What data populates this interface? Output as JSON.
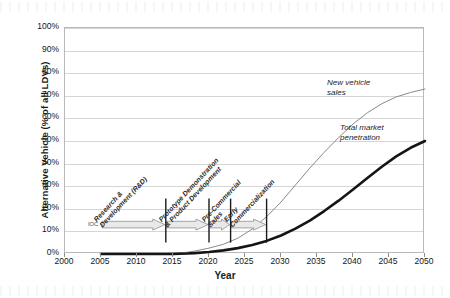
{
  "chart_data": {
    "type": "line",
    "title": "",
    "xlabel": "Year",
    "ylabel": "Alternative Vehicle (% of all LDVs)",
    "xlim": [
      2000,
      2050
    ],
    "ylim": [
      0,
      100
    ],
    "grid": true,
    "legend_position": "inline-callout",
    "x_ticks": [
      "2000",
      "2005",
      "2010",
      "2015",
      "2020",
      "2025",
      "2030",
      "2035",
      "2040",
      "2045",
      "2050"
    ],
    "y_ticks": [
      "0%",
      "10%",
      "20%",
      "30%",
      "40%",
      "50%",
      "60%",
      "70%",
      "80%",
      "90%",
      "100%"
    ],
    "x": [
      2005,
      2010,
      2015,
      2017,
      2018,
      2020,
      2022,
      2024,
      2026,
      2028,
      2030,
      2032,
      2034,
      2036,
      2038,
      2040,
      2042,
      2044,
      2046,
      2048,
      2050
    ],
    "series": [
      {
        "name": "New vehicle sales",
        "color": "#8a8a8a",
        "width": 1,
        "values": [
          0,
          0,
          0.3,
          0.8,
          1.3,
          2.6,
          4.3,
          7.0,
          11.0,
          16.5,
          23.0,
          30.5,
          38.0,
          45.0,
          51.5,
          57.5,
          62.5,
          66.5,
          69.5,
          71.5,
          73.0
        ]
      },
      {
        "name": "Total market penetration",
        "color": "#151515",
        "width": 2.6,
        "values": [
          0,
          0,
          0,
          0.2,
          0.4,
          0.9,
          1.6,
          2.6,
          4.0,
          5.8,
          8.2,
          11.2,
          14.8,
          19.0,
          23.6,
          28.5,
          33.6,
          38.6,
          43.2,
          47.0,
          50.0
        ]
      }
    ],
    "series_callouts": [
      {
        "label": "New vehicle\nsales",
        "x_px": 327,
        "y_px": 78
      },
      {
        "label": "Total market\npenetration",
        "x_px": 340,
        "y_px": 123
      }
    ],
    "phases": {
      "ioc_label": "IOC",
      "band_y_pct": 13,
      "items": [
        {
          "label": "Research &\nDevelopment (R&D)",
          "start": 2005,
          "end": 2014
        },
        {
          "label": "Prototype Demonstration\n& Product Development",
          "start": 2014,
          "end": 2020
        },
        {
          "label": "Pre-Commercial\nSales",
          "start": 2020,
          "end": 2023
        },
        {
          "label": "Early\nCommercialization",
          "start": 2023,
          "end": 2028
        }
      ],
      "dividers": [
        2014,
        2020,
        2023,
        2028
      ]
    }
  }
}
